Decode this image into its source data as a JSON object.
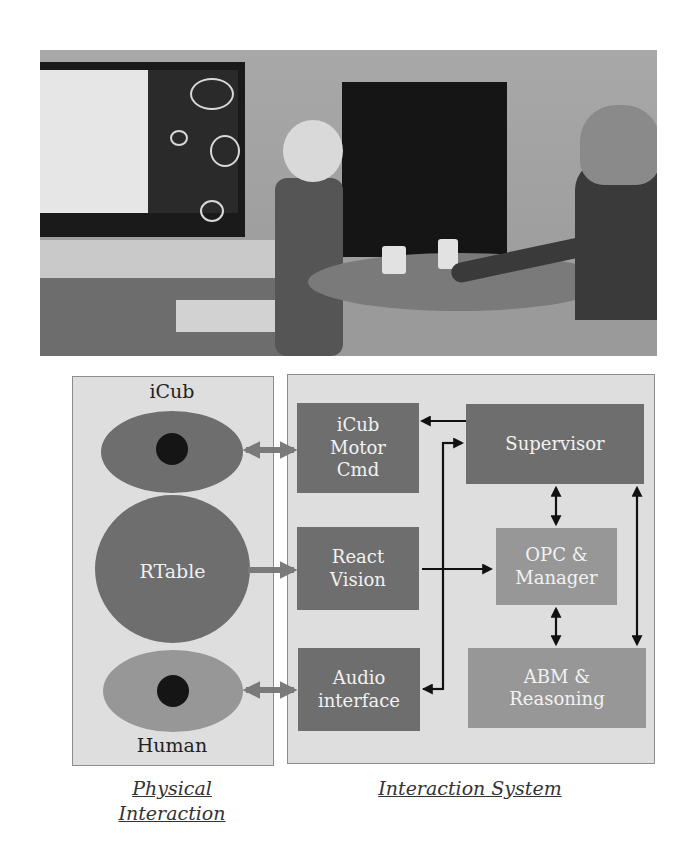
{
  "figure": {
    "photo": {
      "description": "iCub humanoid robot at a round table with a human participant moving cups; monitor shows robot internal state display",
      "elements": [
        "monitor",
        "icub-robot",
        "round-table",
        "cup",
        "cup",
        "human-participant",
        "black-panel"
      ]
    },
    "physical_panel": {
      "entities": [
        {
          "label": "iCub",
          "shape": "ellipse-with-dot"
        },
        {
          "label": "RTable",
          "shape": "circle"
        },
        {
          "label": "Human",
          "shape": "ellipse-with-dot"
        }
      ],
      "caption_line1": "Physical",
      "caption_line2": "Interaction"
    },
    "interaction_panel": {
      "modules": [
        {
          "id": "motor",
          "line1": "iCub",
          "line2": "Motor",
          "line3": "Cmd"
        },
        {
          "id": "vision",
          "line1": "React",
          "line2": "Vision"
        },
        {
          "id": "audio",
          "line1": "Audio",
          "line2": "interface"
        },
        {
          "id": "supervisor",
          "line1": "Supervisor"
        },
        {
          "id": "opc",
          "line1": "OPC &",
          "line2": "Manager"
        },
        {
          "id": "abm",
          "line1": "ABM &",
          "line2": "Reasoning"
        }
      ],
      "caption": "Interaction System"
    },
    "connections": [
      {
        "from": "iCub",
        "to": "iCub Motor Cmd",
        "type": "bidirectional"
      },
      {
        "from": "RTable",
        "to": "React Vision",
        "type": "directed"
      },
      {
        "from": "Human",
        "to": "Audio interface",
        "type": "bidirectional"
      },
      {
        "from": "Supervisor",
        "to": "iCub Motor Cmd",
        "type": "directed"
      },
      {
        "from": "React Vision",
        "to": "OPC & Manager",
        "type": "directed"
      },
      {
        "from": "Audio interface",
        "to": "Supervisor",
        "type": "directed"
      },
      {
        "from": "Supervisor",
        "to": "Audio interface",
        "type": "directed"
      },
      {
        "from": "Supervisor",
        "to": "OPC & Manager",
        "type": "bidirectional"
      },
      {
        "from": "OPC & Manager",
        "to": "ABM & Reasoning",
        "type": "bidirectional"
      },
      {
        "from": "Supervisor",
        "to": "ABM & Reasoning",
        "type": "bidirectional"
      }
    ]
  }
}
